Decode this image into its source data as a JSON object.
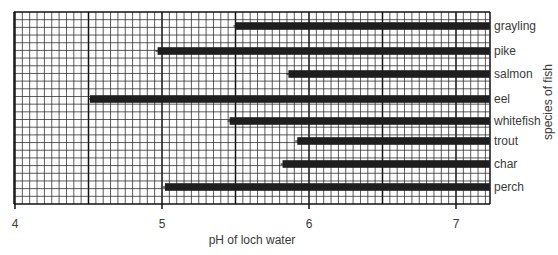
{
  "chart_data": {
    "type": "bar",
    "orientation": "horizontal",
    "title": "",
    "xlabel": "pH of loch water",
    "ylabel": "species of fish",
    "xlim": [
      4,
      7.23
    ],
    "x_ticks": [
      4,
      5,
      6,
      7
    ],
    "x_tick_labels": [
      "4",
      "5",
      "6",
      "7"
    ],
    "grid": {
      "on": true,
      "minor_step": 0.05,
      "major_step": 0.5,
      "style": "graph paper"
    },
    "legend": null,
    "categories": [
      "grayling",
      "pike",
      "salmon",
      "eel",
      "whitefish",
      "trout",
      "char",
      "perch"
    ],
    "series": [
      {
        "name": "pH range tolerated (lower limit shown, bars extend beyond 7)",
        "start_values": [
          5.5,
          4.97,
          5.86,
          4.51,
          5.46,
          5.92,
          5.82,
          5.02
        ],
        "end_values": [
          7.23,
          7.23,
          7.23,
          7.23,
          7.23,
          7.23,
          7.23,
          7.23
        ]
      }
    ],
    "category_label_position": "right",
    "bar_color": "#1e1e1e"
  },
  "axis": {
    "x_title": "pH of loch water",
    "y_title": "species of fish"
  }
}
